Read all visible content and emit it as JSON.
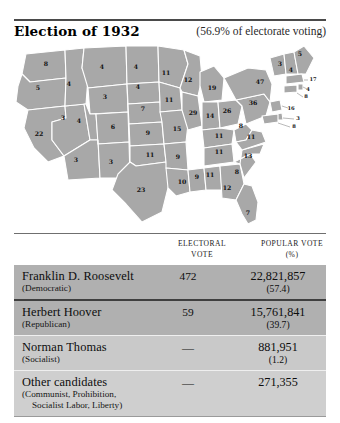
{
  "header": {
    "title": "Election of 1932",
    "turnout": "(56.9% of electorate voting)"
  },
  "map": {
    "name": "united-states-electoral-map-1932",
    "state_fill": "#a8a8a8",
    "border_color": "#ffffff",
    "states": [
      {
        "code": "WA",
        "label": "8",
        "x": 38,
        "y": 22
      },
      {
        "code": "OR",
        "label": "5",
        "x": 30,
        "y": 46
      },
      {
        "code": "CA",
        "label": "22",
        "x": 31,
        "y": 92
      },
      {
        "code": "NV",
        "label": "3",
        "x": 55,
        "y": 76
      },
      {
        "code": "ID",
        "label": "4",
        "x": 61,
        "y": 42
      },
      {
        "code": "MT",
        "label": "4",
        "x": 94,
        "y": 25
      },
      {
        "code": "WY",
        "label": "3",
        "x": 97,
        "y": 55
      },
      {
        "code": "UT",
        "label": "4",
        "x": 71,
        "y": 79
      },
      {
        "code": "AZ",
        "label": "3",
        "x": 68,
        "y": 118
      },
      {
        "code": "CO",
        "label": "6",
        "x": 105,
        "y": 85
      },
      {
        "code": "NM",
        "label": "3",
        "x": 103,
        "y": 120
      },
      {
        "code": "ND",
        "label": "4",
        "x": 128,
        "y": 25
      },
      {
        "code": "SD",
        "label": "4",
        "x": 130,
        "y": 45
      },
      {
        "code": "NE",
        "label": "7",
        "x": 135,
        "y": 67
      },
      {
        "code": "KS",
        "label": "9",
        "x": 140,
        "y": 91
      },
      {
        "code": "OK",
        "label": "11",
        "x": 142,
        "y": 113
      },
      {
        "code": "TX",
        "label": "23",
        "x": 133,
        "y": 148
      },
      {
        "code": "MN",
        "label": "11",
        "x": 158,
        "y": 31
      },
      {
        "code": "IA",
        "label": "11",
        "x": 161,
        "y": 58
      },
      {
        "code": "MO",
        "label": "15",
        "x": 169,
        "y": 87
      },
      {
        "code": "AR",
        "label": "9",
        "x": 170,
        "y": 115
      },
      {
        "code": "LA",
        "label": "10",
        "x": 174,
        "y": 140
      },
      {
        "code": "WI",
        "label": "12",
        "x": 180,
        "y": 38
      },
      {
        "code": "IL",
        "label": "29",
        "x": 185,
        "y": 71
      },
      {
        "code": "MS",
        "label": "9",
        "x": 189,
        "y": 135
      },
      {
        "code": "MI",
        "label": "19",
        "x": 204,
        "y": 46
      },
      {
        "code": "IN",
        "label": "14",
        "x": 202,
        "y": 74
      },
      {
        "code": "AL",
        "label": "11",
        "x": 202,
        "y": 133
      },
      {
        "code": "KY",
        "label": "11",
        "x": 211,
        "y": 94
      },
      {
        "code": "TN",
        "label": "11",
        "x": 211,
        "y": 110
      },
      {
        "code": "OH",
        "label": "26",
        "x": 219,
        "y": 69
      },
      {
        "code": "GA",
        "label": "12",
        "x": 219,
        "y": 146
      },
      {
        "code": "SC",
        "label": "8",
        "x": 229,
        "y": 130
      },
      {
        "code": "WV",
        "label": "8",
        "x": 233,
        "y": 84
      },
      {
        "code": "NC",
        "label": "13",
        "x": 240,
        "y": 114
      },
      {
        "code": "VA",
        "label": "11",
        "x": 243,
        "y": 95
      },
      {
        "code": "FL",
        "label": "7",
        "x": 240,
        "y": 171
      },
      {
        "code": "PA",
        "label": "36",
        "x": 245,
        "y": 61
      },
      {
        "code": "NY",
        "label": "47",
        "x": 252,
        "y": 40
      },
      {
        "code": "VT",
        "label": "3",
        "x": 272,
        "y": 22
      },
      {
        "code": "NH",
        "label": "4",
        "x": 283,
        "y": 28
      },
      {
        "code": "ME",
        "label": "5",
        "x": 292,
        "y": 12
      }
    ],
    "callouts": [
      {
        "code": "MA",
        "label": "17",
        "x": 305,
        "y": 37
      },
      {
        "code": "RI",
        "label": "4",
        "x": 300,
        "y": 47
      },
      {
        "code": "CT",
        "label": "8",
        "x": 298,
        "y": 54
      },
      {
        "code": "NJ",
        "label": "16",
        "x": 283,
        "y": 66
      },
      {
        "code": "DE",
        "label": "3",
        "x": 290,
        "y": 76
      },
      {
        "code": "MD",
        "label": "8",
        "x": 286,
        "y": 84
      }
    ]
  },
  "table": {
    "columns": {
      "electoral_line1": "ELECTORAL",
      "electoral_line2": "VOTE",
      "popular_line1": "POPULAR VOTE",
      "popular_line2": "(%)"
    },
    "rows": [
      {
        "candidate": "Franklin D. Roosevelt",
        "party": "(Democratic)",
        "party_extra": "",
        "electoral": "472",
        "popular": "22,821,857",
        "percent": "(57.4)"
      },
      {
        "candidate": "Herbert Hoover",
        "party": "(Republican)",
        "party_extra": "",
        "electoral": "59",
        "popular": "15,761,841",
        "percent": "(39.7)"
      },
      {
        "candidate": "Norman Thomas",
        "party": "(Socialist)",
        "party_extra": "",
        "electoral": "—",
        "popular": "881,951",
        "percent": "(1.2)"
      },
      {
        "candidate": "Other candidates",
        "party": "(Communist, Prohibition,",
        "party_extra": "Socialist Labor, Liberty)",
        "electoral": "—",
        "popular": "271,355",
        "percent": ""
      }
    ]
  }
}
